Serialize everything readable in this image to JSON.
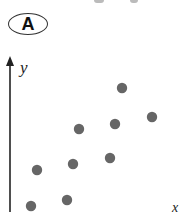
{
  "panel_label": "A",
  "chart_data": {
    "type": "scatter",
    "title": "",
    "xlabel": "x",
    "ylabel": "y",
    "grid": false,
    "legend": null,
    "axis_ticks": "none (no numeric scale shown)",
    "units_note": "values are pixel-derived relative positions (x from y-axis, y up from image bottom); no numeric scale is shown",
    "xlim": [
      0,
      170
    ],
    "ylim": [
      0,
      150
    ],
    "points": [
      {
        "x": 21,
        "y": 6
      },
      {
        "x": 57,
        "y": 12
      },
      {
        "x": 27,
        "y": 42
      },
      {
        "x": 63,
        "y": 48
      },
      {
        "x": 100,
        "y": 54
      },
      {
        "x": 69,
        "y": 83
      },
      {
        "x": 105,
        "y": 88
      },
      {
        "x": 142,
        "y": 95
      },
      {
        "x": 112,
        "y": 124
      }
    ],
    "point_color": "#666666",
    "axis_color": "#222222"
  }
}
